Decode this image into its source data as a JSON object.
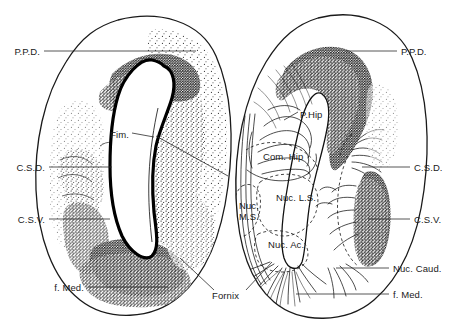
{
  "figure": {
    "title": "",
    "background_color": "#ffffff",
    "ink_color": "#1a1a1a",
    "width": 464,
    "height": 331,
    "panels": [
      {
        "name": "left-hemisphere-section",
        "side": "left",
        "technique": "stipple-cell-stain"
      },
      {
        "name": "right-hemisphere-section",
        "side": "right",
        "technique": "fiber-tract-drawing"
      }
    ]
  },
  "labels": {
    "left": [
      {
        "key": "ppd",
        "text": "P.P.D.",
        "x": 40,
        "y": 54,
        "anchor": "end",
        "leader_to_x": 196,
        "leader_to_y": 54
      },
      {
        "key": "fim",
        "text": "Fim.",
        "x": 128,
        "y": 136,
        "anchor": "end",
        "leader_to_x": 152,
        "leader_to_y": 136
      },
      {
        "key": "csd",
        "text": "C.S.D.",
        "x": 45,
        "y": 170,
        "anchor": "end",
        "leader_to_x": 108,
        "leader_to_y": 166
      },
      {
        "key": "csv",
        "text": "C.S.V.",
        "x": 45,
        "y": 222,
        "anchor": "end",
        "leader_to_x": 107,
        "leader_to_y": 218
      },
      {
        "key": "fmed",
        "text": "f. Med.",
        "x": 84,
        "y": 290,
        "anchor": "end",
        "leader_to_x": 162,
        "leader_to_y": 288
      }
    ],
    "right": [
      {
        "key": "ppd",
        "text": "P.P.D.",
        "x": 401,
        "y": 54,
        "anchor": "start",
        "leader_to_x": 352,
        "leader_to_y": 52
      },
      {
        "key": "csd",
        "text": "C.S.D.",
        "x": 414,
        "y": 170,
        "anchor": "start",
        "leader_to_x": 366,
        "leader_to_y": 166
      },
      {
        "key": "csv",
        "text": "C.S.V.",
        "x": 414,
        "y": 222,
        "anchor": "start",
        "leader_to_x": 370,
        "leader_to_y": 218
      },
      {
        "key": "nuccaud",
        "text": "Nuc. Caud.",
        "x": 393,
        "y": 271,
        "anchor": "start",
        "leader_to_x": 340,
        "leader_to_y": 268
      },
      {
        "key": "fmed",
        "text": "f. Med.",
        "x": 393,
        "y": 297,
        "anchor": "start",
        "leader_to_x": 300,
        "leader_to_y": 294
      }
    ],
    "interior": [
      {
        "key": "phip",
        "text": "P.Hip",
        "x": 300,
        "y": 115,
        "anchor": "start"
      },
      {
        "key": "comhip",
        "text": "Com. Hip",
        "x": 264,
        "y": 157,
        "anchor": "start"
      },
      {
        "key": "nucls",
        "text": "Nuc. L.S.",
        "x": 276,
        "y": 198,
        "anchor": "start"
      },
      {
        "key": "nucms1",
        "text": "Nuc.",
        "x": 240,
        "y": 206,
        "anchor": "start"
      },
      {
        "key": "nucms2",
        "text": "M.S.",
        "x": 240,
        "y": 217,
        "anchor": "start"
      },
      {
        "key": "nucac",
        "text": "Nuc. Ac.",
        "x": 268,
        "y": 245,
        "anchor": "start"
      },
      {
        "key": "fornix",
        "text": "Fornix",
        "x": 212,
        "y": 296,
        "anchor": "start"
      }
    ]
  },
  "abbreviations": {
    "P.P.D.": "posterior pallium dorsale",
    "Fim.": "fimbria",
    "C.S.D.": "corpus striatum dorsale",
    "C.S.V.": "corpus striatum ventrale",
    "f. Med.": "fasciculus medialis",
    "Fornix": "fornix",
    "P.Hip": "primordium hippocampi",
    "Com. Hip": "commissura hippocampi",
    "Nuc. L.S.": "nucleus lateralis septi",
    "Nuc. M.S.": "nucleus medialis septi",
    "Nuc. Ac.": "nucleus accumbens",
    "Nuc. Caud.": "nucleus caudatus"
  }
}
